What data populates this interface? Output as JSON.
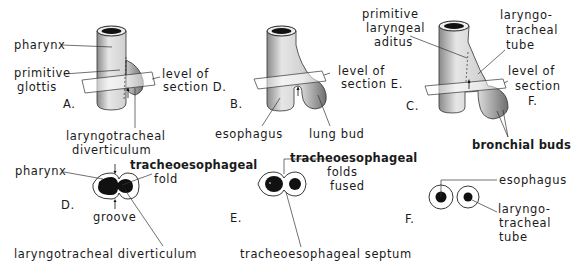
{
  "figure": {
    "panels": [
      {
        "id": "A",
        "label": "A.",
        "annotations": [
          "pharynx",
          "primitive glottis",
          "level of section D.",
          "laryngotracheal diverticulum"
        ]
      },
      {
        "id": "B",
        "label": "B.",
        "annotations": [
          "level of section E.",
          "esophagus",
          "lung bud"
        ]
      },
      {
        "id": "C",
        "label": "C.",
        "annotations": [
          "primitive laryngeal aditus",
          "laryngo-tracheal tube",
          "level of section F.",
          "bronchial buds"
        ]
      },
      {
        "id": "D",
        "label": "D.",
        "annotations": [
          "pharynx",
          "tracheoesophageal fold",
          "groove",
          "laryngotracheal diverticulum"
        ]
      },
      {
        "id": "E",
        "label": "E.",
        "annotations": [
          "tracheoesophageal folds fused",
          "tracheoesophageal septum"
        ]
      },
      {
        "id": "F",
        "label": "F.",
        "annotations": [
          "esophagus",
          "laryngo-tracheal tube"
        ]
      }
    ]
  },
  "labels": {
    "a_pharynx": "pharynx",
    "a_primitive": "primitive",
    "a_glottis": "glottis",
    "a_panel": "A.",
    "a_level1": "level of",
    "a_level2": "section D.",
    "a_diver1": "laryngotracheal",
    "a_diver2": "diverticulum",
    "b_panel": "B.",
    "b_level1": "level of",
    "b_level2": "section E.",
    "b_esophagus": "esophagus",
    "b_lungbud": "lung bud",
    "c_aditus1": "primitive",
    "c_aditus2": "laryngeal",
    "c_aditus3": "aditus",
    "c_tube1": "laryngo-",
    "c_tube2": "tracheal",
    "c_tube3": "tube",
    "c_panel": "C.",
    "c_level1": "level of",
    "c_level2": "section",
    "c_level3": "F.",
    "c_bronchial": "bronchial buds",
    "d_pharynx": "pharynx",
    "d_fold1": "tracheoesophageal",
    "d_fold2": "fold",
    "d_panel": "D.",
    "d_groove": "groove",
    "d_diver": "laryngotracheal  diverticulum",
    "e_folds1": "tracheoesophageal",
    "e_folds2": "folds",
    "e_folds3": "fused",
    "e_panel": "E.",
    "e_septum": "tracheoesophageal septum",
    "f_esophagus": "esophagus",
    "f_panel": "F.",
    "f_tube1": "laryngo-",
    "f_tube2": "tracheal",
    "f_tube3": "tube"
  }
}
